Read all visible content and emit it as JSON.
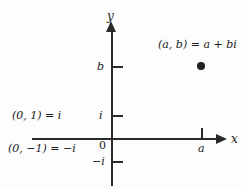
{
  "figure": {
    "background_color": "#fdfdfd",
    "line_color": "#2a2a2a",
    "text_color": "#1a1a1a"
  },
  "axes": {
    "x_name": "x",
    "y_name": "y",
    "origin_label": "0"
  },
  "ticks": {
    "y": [
      {
        "label": "b",
        "position_note": "upper"
      },
      {
        "label": "i",
        "position_note": "unit imaginary"
      },
      {
        "label": "−i",
        "position_note": "negative unit imaginary"
      }
    ],
    "x": [
      {
        "label": "a",
        "position_note": "right"
      }
    ]
  },
  "annotations": {
    "point_label": "(a, b) = a + bi",
    "i_label": "(0, 1) = i",
    "neg_i_label": "(0, −1) = −i"
  },
  "chart_data": {
    "type": "scatter",
    "xlabel": "x",
    "ylabel": "y",
    "grid": false,
    "legend": null,
    "x_ticks": [
      {
        "value": "a",
        "label": "a"
      }
    ],
    "y_ticks": [
      {
        "value": "b",
        "label": "b"
      },
      {
        "value": "1",
        "label": "i"
      },
      {
        "value": "0",
        "label": "0"
      },
      {
        "value": "-1",
        "label": "−i"
      }
    ],
    "points": [
      {
        "x": "a",
        "y": "b",
        "label": "(a, b) = a + bi"
      }
    ],
    "annotations": [
      "(0, 1) = i",
      "(0, −1) = −i",
      "(a, b) = a + bi"
    ]
  }
}
